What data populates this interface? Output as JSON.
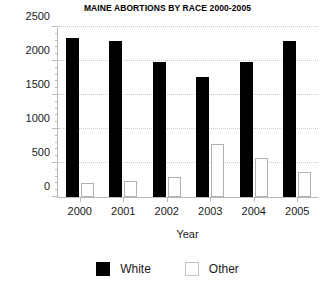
{
  "chart_data": {
    "type": "bar",
    "title": "MAINE ABORTIONS BY RACE 2000-2005",
    "xlabel": "Year",
    "ylabel": "",
    "categories": [
      "2000",
      "2001",
      "2002",
      "2003",
      "2004",
      "2005"
    ],
    "series": [
      {
        "name": "White",
        "color": "#000000",
        "values": [
          2345,
          2300,
          1980,
          1760,
          1985,
          2290
        ]
      },
      {
        "name": "Other",
        "color": "#ffffff",
        "values": [
          205,
          235,
          300,
          780,
          570,
          365
        ]
      }
    ],
    "ylim": [
      0,
      2500
    ],
    "ytick_values": [
      0,
      500,
      1000,
      1500,
      2000,
      2500
    ],
    "ytick_labels": [
      "0",
      "500",
      "1000",
      "1500",
      "2000",
      "2500"
    ],
    "yminor_step": 100,
    "grid": true,
    "grid_style": "dotted",
    "legend_position": "bottom"
  },
  "legend": {
    "items": [
      {
        "label": "White",
        "swatch": "filled-black-square"
      },
      {
        "label": "Other",
        "swatch": "open-white-square"
      }
    ]
  }
}
